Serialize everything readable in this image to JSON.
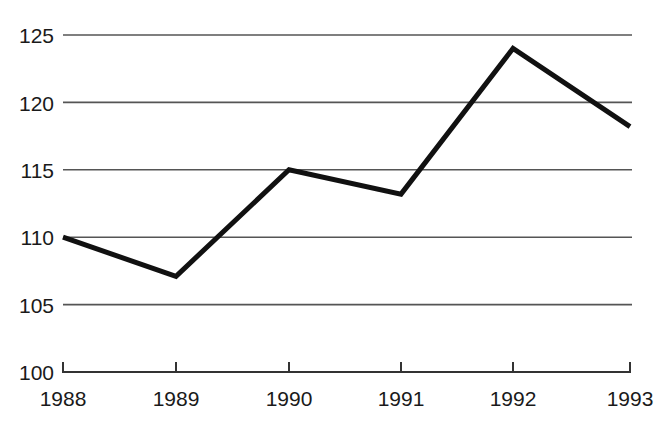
{
  "chart_data": {
    "type": "line",
    "title": "",
    "subtitle": "",
    "xlabel": "",
    "ylabel": "",
    "categories": [
      "1988",
      "1989",
      "1990",
      "1991",
      "1992",
      "1993"
    ],
    "x": [
      1988,
      1989,
      1990,
      1991,
      1992,
      1993
    ],
    "values": [
      110,
      107.1,
      115,
      113.2,
      124,
      118.2
    ],
    "series": [
      {
        "name": "index",
        "values": [
          110,
          107.1,
          115,
          113.2,
          124,
          118.2
        ]
      }
    ],
    "ylim": [
      100,
      125
    ],
    "yticks": [
      100,
      105,
      110,
      115,
      120,
      125
    ],
    "ytick_labels": [
      "100",
      "105",
      "110",
      "115",
      "120",
      "125"
    ],
    "xtick_labels": [
      "1988",
      "1989",
      "1990",
      "1991",
      "1992",
      "1993"
    ],
    "grid": true,
    "grid_axis": "y",
    "legend": false,
    "legend_position": "none",
    "annotations": [],
    "line_color": "#111111",
    "grid_color": "#555555",
    "axis_color": "#333333",
    "background_color": "#ffffff",
    "line_width": 5
  },
  "geometry": {
    "plot_left": 63,
    "plot_right": 632,
    "plot_top": 35,
    "plot_bottom": 372,
    "y_pixels": [
      372,
      305,
      170,
      237,
      103,
      35
    ],
    "tick_x": [
      63,
      176,
      289,
      401,
      513,
      630
    ]
  }
}
